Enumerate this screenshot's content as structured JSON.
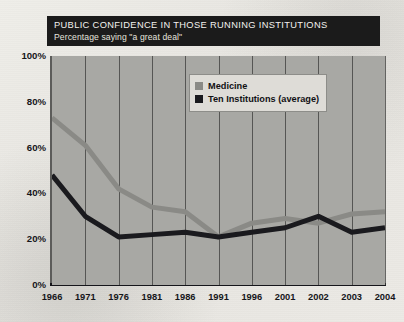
{
  "title": {
    "main": "PUBLIC CONFIDENCE IN THOSE RUNNING INSTITUTIONS",
    "sub": "Percentage saying \"a great deal\""
  },
  "legend": {
    "items": [
      {
        "label": "Medicine",
        "color": "#8a8a86",
        "swatch_name": "legend-swatch-medicine"
      },
      {
        "label": "Ten Institutions (average)",
        "color": "#1a1a1e",
        "swatch_name": "legend-swatch-ten-institutions"
      }
    ]
  },
  "colors": {
    "plot_background": "#a8a8a4",
    "gridline": "#3b3b3a",
    "axis": "#15151a",
    "title_background": "#1b1b1b",
    "title_text": "#f3f2ee",
    "medicine": "#8a8a86",
    "ten_institutions": "#1a1a1e"
  },
  "chart_data": {
    "type": "line",
    "title": "PUBLIC CONFIDENCE IN THOSE RUNNING INSTITUTIONS",
    "subtitle": "Percentage saying \"a great deal\"",
    "xlabel": "",
    "ylabel": "",
    "categories": [
      "1966",
      "1971",
      "1976",
      "1981",
      "1986",
      "1991",
      "1996",
      "2001",
      "2002",
      "2003",
      "2004"
    ],
    "ylim": [
      0,
      100
    ],
    "yticks": [
      0,
      20,
      40,
      60,
      80,
      100
    ],
    "ytick_labels": [
      "0%",
      "20%",
      "40%",
      "60%",
      "80%",
      "100%"
    ],
    "grid": "vertical",
    "legend_position": "upper-right-inside",
    "series": [
      {
        "name": "Medicine",
        "color": "#8a8a86",
        "values": [
          73,
          61,
          42,
          34,
          32,
          21,
          27,
          29,
          27,
          31,
          32
        ]
      },
      {
        "name": "Ten Institutions (average)",
        "color": "#1a1a1e",
        "values": [
          48,
          30,
          21,
          22,
          23,
          21,
          23,
          25,
          30,
          23,
          25
        ]
      }
    ]
  }
}
